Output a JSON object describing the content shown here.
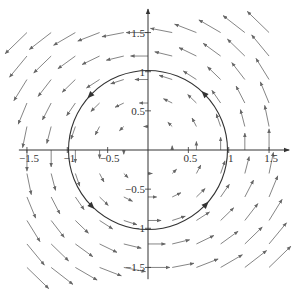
{
  "figure": {
    "colors": {
      "background": "#ffffff",
      "axes": "#333333",
      "arrows": "#777777",
      "circle": "#333333",
      "labels": "#333333"
    },
    "axes": {
      "origin_px": [
        148,
        150
      ],
      "px_per_unit_x": 80.7,
      "px_per_unit_y": 78.3,
      "x_range": [
        -1.6,
        1.75
      ],
      "y_range": [
        -1.65,
        1.8
      ],
      "x_tick_labels": [
        {
          "value": -1.5,
          "label": "−1.5"
        },
        {
          "value": -1,
          "label": "−1"
        },
        {
          "value": -0.5,
          "label": "−0.5"
        },
        {
          "value": 0.5,
          "label": "0.5"
        },
        {
          "value": 1,
          "label": "1"
        },
        {
          "value": 1.5,
          "label": "1.5"
        }
      ],
      "y_tick_labels": [
        {
          "value": 1.5,
          "label": "1.5"
        },
        {
          "value": 1,
          "label": "1"
        },
        {
          "value": 0.5,
          "label": "0.5"
        },
        {
          "value": -0.5,
          "label": "−0.5"
        },
        {
          "value": -1,
          "label": "−1"
        },
        {
          "value": -1.5,
          "label": "−1.5"
        }
      ]
    },
    "vector_field": {
      "formula": "F(x,y) = (-y, x)",
      "grid_values": [
        -1.5,
        -1.2,
        -0.9,
        -0.6,
        -0.3,
        0,
        0.3,
        0.6,
        0.9,
        1.2,
        1.5
      ],
      "arrow_scale": 0.18
    },
    "circle": {
      "center": [
        0,
        0
      ],
      "radius": 1,
      "orientation": "counterclockwise",
      "arrow_angles_deg": [
        45,
        135,
        225,
        315
      ]
    }
  }
}
